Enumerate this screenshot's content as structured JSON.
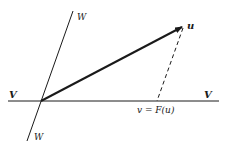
{
  "figure": {
    "type": "vector-projection-diagram",
    "colors": {
      "ink": "#1a1a1a",
      "background": "#ffffff"
    },
    "lines": {
      "V": {
        "label_left": "V",
        "label_right": "V",
        "x1": 8,
        "y1": 101,
        "x2": 219,
        "y2": 101
      },
      "W": {
        "label_top": "W",
        "label_bottom": "W",
        "x1": 73,
        "y1": 11,
        "x2": 27,
        "y2": 141
      }
    },
    "vector_u": {
      "label": "u",
      "from": [
        41,
        101
      ],
      "to": [
        184,
        26
      ]
    },
    "projection": {
      "label": "v = F(u)",
      "from": [
        183,
        28
      ],
      "to": [
        157,
        101
      ],
      "style": "dashed"
    }
  }
}
